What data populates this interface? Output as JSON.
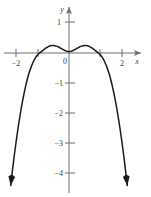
{
  "figure": {
    "title": "",
    "background_color": "#ffffff",
    "axis_color": "#6e6e6e",
    "curve_color": "#1a1a1a",
    "width_px": 151,
    "height_px": 197
  },
  "axes": {
    "x_axis_label": "x",
    "y_axis_label": "y",
    "x_ticks": [
      {
        "value": -2,
        "label": "−2"
      },
      {
        "value": -1,
        "label": ""
      },
      {
        "value": 1,
        "label": ""
      },
      {
        "value": 2,
        "label": "2"
      }
    ],
    "y_ticks": [
      {
        "value": 1,
        "label": "1"
      },
      {
        "value": -1,
        "label": "−1"
      },
      {
        "value": -2,
        "label": "−2"
      },
      {
        "value": -3,
        "label": "−3"
      },
      {
        "value": -4,
        "label": "−4"
      }
    ],
    "origin_label": "0"
  },
  "chart_data": {
    "type": "line",
    "title": "",
    "xlabel": "x",
    "ylabel": "y",
    "xlim": [
      -2.2,
      2.3
    ],
    "ylim": [
      -4.7,
      1.5
    ],
    "grid": false,
    "legend": null,
    "x_tick_values": [
      -2,
      -1,
      1,
      2
    ],
    "x_tick_labels": [
      "−2",
      "",
      "",
      "2"
    ],
    "y_tick_values": [
      1,
      -1,
      -2,
      -3,
      -4
    ],
    "y_tick_labels": [
      "1",
      "−1",
      "−2",
      "−3",
      "−4"
    ],
    "annotations": [
      {
        "text": "0",
        "x": 0,
        "y": 0,
        "role": "origin-label"
      }
    ],
    "series": [
      {
        "name": "curve",
        "description": "Quartic-like curve with local minimum near the origin, two local maxima just above the x-axis near x = ±0.55, x-intercepts near x = ±1, and both branches descending steeply to arrow tips near y = −4.4.",
        "arrow_ends": [
          "left-down",
          "right-down"
        ],
        "x": [
          -1.88,
          -1.84,
          -1.8,
          -1.75,
          -1.7,
          -1.65,
          -1.6,
          -1.55,
          -1.5,
          -1.45,
          -1.4,
          -1.35,
          -1.3,
          -1.25,
          -1.2,
          -1.15,
          -1.1,
          -1.05,
          -1.0,
          -0.95,
          -0.9,
          -0.85,
          -0.8,
          -0.75,
          -0.7,
          -0.65,
          -0.6,
          -0.55,
          -0.5,
          -0.45,
          -0.4,
          -0.35,
          -0.3,
          -0.25,
          -0.2,
          -0.15,
          -0.1,
          -0.05,
          0.0,
          0.05,
          0.1,
          0.15,
          0.2,
          0.25,
          0.3,
          0.35,
          0.4,
          0.45,
          0.5,
          0.55,
          0.6,
          0.65,
          0.7,
          0.75,
          0.8,
          0.85,
          0.9,
          0.95,
          1.0,
          1.05,
          1.1,
          1.15,
          1.2,
          1.25,
          1.3,
          1.35,
          1.4,
          1.45,
          1.5,
          1.55,
          1.6,
          1.65,
          1.7,
          1.75,
          1.8,
          1.84,
          1.88
        ],
        "y": [
          -4.42,
          -4.06,
          -3.71,
          -3.3,
          -2.91,
          -2.55,
          -2.21,
          -1.9,
          -1.61,
          -1.35,
          -1.11,
          -0.9,
          -0.71,
          -0.55,
          -0.41,
          -0.29,
          -0.19,
          -0.11,
          -0.05,
          0.0,
          0.04,
          0.08,
          0.12,
          0.16,
          0.19,
          0.22,
          0.24,
          0.25,
          0.25,
          0.24,
          0.23,
          0.21,
          0.18,
          0.15,
          0.12,
          0.09,
          0.07,
          0.05,
          0.05,
          0.05,
          0.07,
          0.09,
          0.12,
          0.15,
          0.18,
          0.21,
          0.23,
          0.24,
          0.25,
          0.25,
          0.24,
          0.22,
          0.19,
          0.16,
          0.12,
          0.08,
          0.04,
          0.0,
          -0.05,
          -0.11,
          -0.19,
          -0.29,
          -0.41,
          -0.55,
          -0.71,
          -0.9,
          -1.11,
          -1.35,
          -1.61,
          -1.9,
          -2.21,
          -2.55,
          -2.91,
          -3.3,
          -3.71,
          -4.06,
          -4.42
        ]
      }
    ]
  }
}
